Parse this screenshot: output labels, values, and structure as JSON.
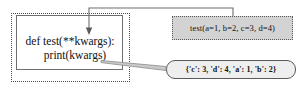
{
  "diagram": {
    "title_present": false,
    "code_block": {
      "line_1": "def test(**kwargs):",
      "line_2": "print(kwargs)"
    },
    "call_box": {
      "label": "test(a=1, b=2, c=3, d=4)",
      "fill_color": "#d3d3d3",
      "border_color": "#5a5a5a",
      "text_color": "#121212"
    },
    "output_box": {
      "label": "{'c': 3, 'd': 4, 'a': 1, 'b': 2}",
      "fill_color": "#eeeeee",
      "border_color": "#5a5a5a",
      "text_color": "#121212"
    },
    "connectors": [
      {
        "name": "call-to-parameter-arrow",
        "from": "call_box",
        "to": "code_block_parameters",
        "style": "elbow-with-arrowhead",
        "color": "#6e6e6e"
      },
      {
        "name": "print-to-output-wedge",
        "from": "code_block_print",
        "to": "output_box",
        "style": "tapered-wedge",
        "color": "#8c8c8c"
      }
    ],
    "outer_box": {
      "border_style": "dotted",
      "border_color": "#4a4a4a"
    },
    "inner_box": {
      "border_style": "solid",
      "border_color": "#6e6e6e"
    }
  }
}
